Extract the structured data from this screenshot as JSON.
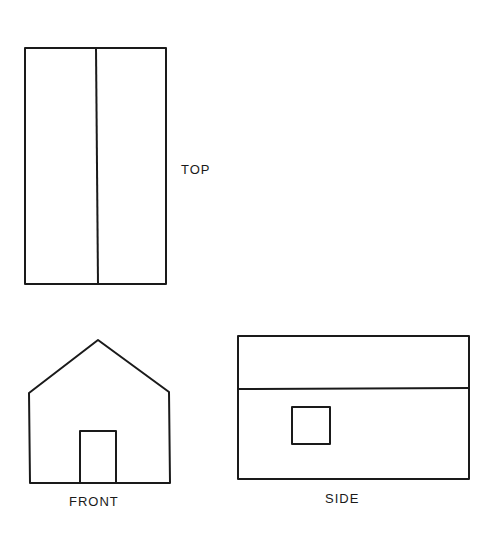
{
  "diagram": {
    "stroke_color": "#1a1a1a",
    "background": "#ffffff",
    "views": {
      "top": {
        "label": "TOP",
        "outline": {
          "x1": 25,
          "y1": 48,
          "x2": 166,
          "y2": 284
        },
        "ridge_line": {
          "x": 96
        }
      },
      "front": {
        "label": "FRONT",
        "outline_points": [
          [
            30,
            483
          ],
          [
            29,
            393
          ],
          [
            98,
            340
          ],
          [
            169,
            392
          ],
          [
            170,
            483
          ]
        ],
        "door": {
          "x1": 80,
          "y1": 431,
          "x2": 116,
          "y2": 482
        }
      },
      "side": {
        "label": "SIDE",
        "outline": {
          "x1": 238,
          "y1": 336,
          "x2": 469,
          "y2": 479
        },
        "roof_line": {
          "y": 389
        },
        "window": {
          "x1": 292,
          "y1": 407,
          "x2": 330,
          "y2": 444
        }
      }
    }
  }
}
